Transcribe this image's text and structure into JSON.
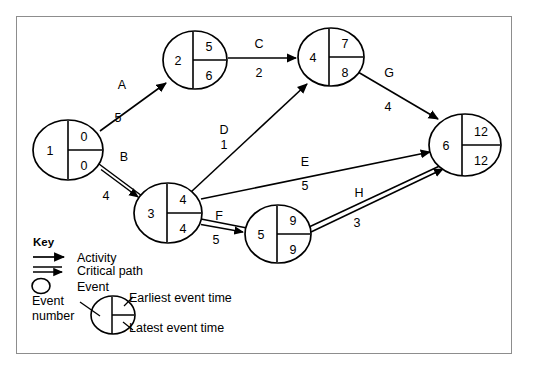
{
  "diagram": {
    "type": "pert-cpm-network",
    "colors": {
      "line": "#000000",
      "frame": "#8d8d8d",
      "background": "#ffffff"
    },
    "nodes": [
      {
        "id": "1",
        "number": "1",
        "earliest": "0",
        "latest": "0",
        "cx": 68,
        "cy": 150,
        "rx": 35,
        "ry": 30
      },
      {
        "id": "2",
        "number": "2",
        "earliest": "5",
        "latest": "6",
        "cx": 195,
        "cy": 60,
        "rx": 32,
        "ry": 29
      },
      {
        "id": "3",
        "number": "3",
        "earliest": "4",
        "latest": "4",
        "cx": 168,
        "cy": 213,
        "rx": 34,
        "ry": 30
      },
      {
        "id": "4",
        "number": "4",
        "earliest": "7",
        "latest": "8",
        "cx": 331,
        "cy": 57,
        "rx": 33,
        "ry": 29
      },
      {
        "id": "5",
        "number": "5",
        "earliest": "9",
        "latest": "9",
        "cx": 278,
        "cy": 234,
        "rx": 33,
        "ry": 29
      },
      {
        "id": "6",
        "number": "6",
        "earliest": "12",
        "latest": "12",
        "cx": 465,
        "cy": 145,
        "rx": 36,
        "ry": 31
      }
    ],
    "activities": [
      {
        "id": "A",
        "label": "A",
        "duration": "5",
        "from": "1",
        "to": "2",
        "critical": false,
        "x1": 100,
        "y1": 131,
        "x2": 166,
        "y2": 83,
        "lx": 122,
        "ly": 89,
        "dx": 118,
        "dy": 122
      },
      {
        "id": "B",
        "label": "B",
        "duration": "4",
        "from": "1",
        "to": "3",
        "critical": true,
        "x1": 99,
        "y1": 166,
        "x2": 139,
        "y2": 196,
        "lx": 124,
        "ly": 161,
        "dx": 106,
        "dy": 200
      },
      {
        "id": "C",
        "label": "C",
        "duration": "2",
        "from": "2",
        "to": "4",
        "critical": false,
        "x1": 228,
        "y1": 58,
        "x2": 297,
        "y2": 58,
        "lx": 258,
        "ly": 48,
        "dx": 259,
        "dy": 76
      },
      {
        "id": "D",
        "label": "D",
        "duration": "1",
        "from": "3",
        "to": "4",
        "critical": false,
        "x1": 191,
        "y1": 192,
        "x2": 306,
        "y2": 85,
        "lx": 224,
        "ly": 134,
        "dx": 224,
        "dy": 148
      },
      {
        "id": "E",
        "label": "E",
        "duration": "5",
        "from": "3",
        "to": "6",
        "critical": false,
        "x1": 201,
        "y1": 199,
        "x2": 429,
        "y2": 153,
        "lx": 305,
        "ly": 165,
        "dx": 305,
        "dy": 190
      },
      {
        "id": "F",
        "label": "F",
        "duration": "5",
        "from": "3",
        "to": "5",
        "critical": true,
        "x1": 201,
        "y1": 222,
        "x2": 245,
        "y2": 231,
        "lx": 218,
        "ly": 220,
        "dx": 215,
        "dy": 243
      },
      {
        "id": "G",
        "label": "G",
        "duration": "4",
        "from": "4",
        "to": "6",
        "critical": false,
        "x1": 358,
        "y1": 72,
        "x2": 437,
        "y2": 119,
        "lx": 388,
        "ly": 77,
        "dx": 388,
        "dy": 110
      },
      {
        "id": "H",
        "label": "H",
        "duration": "3",
        "from": "5",
        "to": "6",
        "critical": true,
        "x1": 308,
        "y1": 230,
        "x2": 443,
        "y2": 166,
        "lx": 358,
        "ly": 197,
        "dx": 357,
        "dy": 226
      }
    ],
    "legend": {
      "heading": "Key",
      "items": [
        {
          "id": "activity",
          "icon": "single-arrow-icon",
          "label": "Activity"
        },
        {
          "id": "critical-path",
          "icon": "double-arrow-icon",
          "label": "Critical path"
        },
        {
          "id": "event",
          "icon": "circle-icon",
          "label": "Event"
        }
      ],
      "event_key": {
        "event_number_line1": "Event",
        "event_number_line2": "number",
        "earliest_label": "Earliest event time",
        "latest_label": "Latest event time"
      }
    }
  }
}
